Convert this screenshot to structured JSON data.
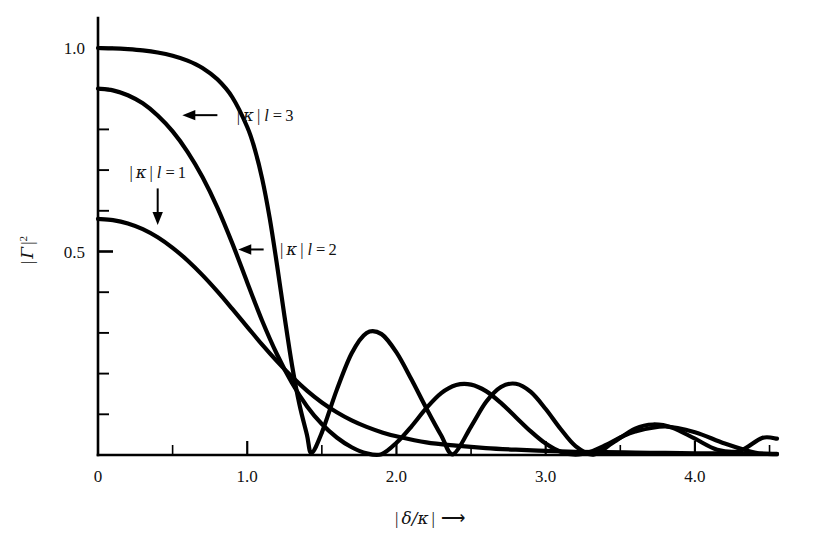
{
  "figure": {
    "kind": "line-plot",
    "background": "#ffffff",
    "ink_color": "#000000"
  },
  "axes": {
    "x": {
      "label": "| δ/κ | ⟶",
      "label_parts": {
        "bar_open": "|",
        "symbol": "δ/κ",
        "bar_close": "|",
        "arrow": "⟶"
      },
      "min": 0,
      "max": 4.55,
      "major_ticks": [
        0,
        1.0,
        2.0,
        3.0,
        4.0
      ],
      "major_tick_labels": [
        "0",
        "1.0",
        "2.0",
        "3.0",
        "4.0"
      ],
      "minor_tick_step": 0.5
    },
    "y": {
      "label": "| Γ |²",
      "label_parts": {
        "bar_open": "|",
        "symbol": "Γ",
        "bar_close": "|",
        "exponent": "2"
      },
      "min": 0,
      "max": 1.12,
      "major_ticks": [
        0.5,
        1.0
      ],
      "major_tick_labels": [
        "0.5",
        "1.0"
      ],
      "minor_tick_step": 0.1
    },
    "frame": {
      "left_spine": true,
      "bottom_spine": true,
      "top_spine": false,
      "right_spine": false
    }
  },
  "annotations": [
    {
      "name": "kappa-l-3",
      "text": "| κ | l = 3",
      "bar_open": "|",
      "symbol": "κ",
      "bar_close": "|",
      "var": "l",
      "eq": "=",
      "value": "3",
      "arrow": "left",
      "text_x": 0.93,
      "text_y": 0.835,
      "arrow_from_x": 0.8,
      "arrow_to_x": 0.565
    },
    {
      "name": "kappa-l-2",
      "text": "| κ | l = 2",
      "bar_open": "|",
      "symbol": "κ",
      "bar_close": "|",
      "var": "l",
      "eq": "=",
      "value": "2",
      "arrow": "left",
      "text_x": 1.22,
      "text_y": 0.505,
      "arrow_from_x": 1.11,
      "arrow_to_x": 0.94
    },
    {
      "name": "kappa-l-1",
      "text": "| κ | l = 1",
      "bar_open": "|",
      "symbol": "κ",
      "bar_close": "|",
      "var": "l",
      "eq": "=",
      "value": "1",
      "arrow": "down",
      "text_x": 0.4,
      "text_y": 0.695,
      "arrow_from_y": 0.655,
      "arrow_to_y": 0.565
    }
  ],
  "chart_data": {
    "type": "line",
    "title": "",
    "xlabel": "| δ/κ |",
    "ylabel": "| Γ |²",
    "xlim": [
      0,
      4.55
    ],
    "ylim": [
      0,
      1.12
    ],
    "grid": false,
    "legend": "inline-annotations",
    "x_major_ticks": [
      0,
      1.0,
      2.0,
      3.0,
      4.0
    ],
    "y_major_ticks": [
      0.5,
      1.0
    ],
    "formula": "|Γ|^2 = sinh^2(s l) / ( cosh^2(s l) - (δ/κ)^2 ), s l = |κ|l*sqrt(1-(δ/κ)^2) inside stopband; sin form outside",
    "series": [
      {
        "name": "|κ|l = 1",
        "kl": 1,
        "peak_value": 0.58,
        "x": [
          0.0,
          0.1,
          0.2,
          0.3,
          0.4,
          0.5,
          0.6,
          0.7,
          0.8,
          0.9,
          1.0,
          1.1,
          1.2,
          1.3,
          1.4,
          1.5,
          1.6,
          1.7,
          1.8,
          1.9,
          2.0,
          2.2,
          2.4,
          2.6,
          2.8,
          3.0,
          3.2,
          3.4,
          3.6,
          3.8,
          4.0,
          4.2,
          4.4,
          4.55
        ],
        "y": [
          0.58,
          0.577,
          0.569,
          0.555,
          0.535,
          0.509,
          0.478,
          0.442,
          0.402,
          0.359,
          0.315,
          0.271,
          0.23,
          0.192,
          0.158,
          0.129,
          0.105,
          0.085,
          0.069,
          0.056,
          0.046,
          0.031,
          0.023,
          0.017,
          0.013,
          0.01,
          0.008,
          0.007,
          0.006,
          0.005,
          0.004,
          0.004,
          0.003,
          0.003
        ]
      },
      {
        "name": "|κ|l = 2",
        "kl": 2,
        "peak_value": 0.9,
        "first_zero": 1.8,
        "second_zero": 2.8,
        "lobe_peaks": [
          {
            "x": 2.3,
            "y": 0.175
          },
          {
            "x": 3.2,
            "y": 0.07
          },
          {
            "x": 4.05,
            "y": 0.04
          }
        ],
        "x": [
          0.0,
          0.1,
          0.2,
          0.3,
          0.4,
          0.5,
          0.6,
          0.7,
          0.8,
          0.9,
          1.0,
          1.1,
          1.2,
          1.3,
          1.4,
          1.5,
          1.6,
          1.7,
          1.8,
          1.9,
          2.0,
          2.1,
          2.2,
          2.3,
          2.4,
          2.5,
          2.6,
          2.7,
          2.8,
          2.9,
          3.0,
          3.1,
          3.2,
          3.3,
          3.4,
          3.5,
          3.6,
          3.8,
          4.0,
          4.2,
          4.4,
          4.55
        ],
        "y": [
          0.9,
          0.896,
          0.884,
          0.864,
          0.834,
          0.795,
          0.745,
          0.683,
          0.608,
          0.52,
          0.424,
          0.33,
          0.247,
          0.177,
          0.12,
          0.076,
          0.043,
          0.019,
          0.004,
          0.002,
          0.03,
          0.07,
          0.115,
          0.152,
          0.172,
          0.173,
          0.157,
          0.128,
          0.093,
          0.058,
          0.028,
          0.008,
          0.001,
          0.008,
          0.024,
          0.043,
          0.058,
          0.07,
          0.056,
          0.028,
          0.006,
          0.002
        ]
      },
      {
        "name": "|κ|l = 3",
        "kl": 3,
        "peak_value": 1.0,
        "first_zero": 1.43,
        "second_zero": 2.38,
        "third_zero": 3.32,
        "lobe_peaks": [
          {
            "x": 1.82,
            "y": 0.3
          },
          {
            "x": 2.62,
            "y": 0.175
          },
          {
            "x": 3.72,
            "y": 0.075
          },
          {
            "x": 4.45,
            "y": 0.045
          }
        ],
        "x": [
          0.0,
          0.1,
          0.2,
          0.3,
          0.4,
          0.5,
          0.6,
          0.7,
          0.8,
          0.9,
          1.0,
          1.05,
          1.1,
          1.15,
          1.2,
          1.25,
          1.3,
          1.35,
          1.4,
          1.43,
          1.5,
          1.6,
          1.7,
          1.8,
          1.9,
          2.0,
          2.1,
          2.2,
          2.3,
          2.38,
          2.5,
          2.6,
          2.7,
          2.8,
          2.9,
          3.0,
          3.1,
          3.2,
          3.32,
          3.45,
          3.6,
          3.72,
          3.85,
          4.0,
          4.15,
          4.3,
          4.45,
          4.55
        ],
        "y": [
          1.0,
          0.999,
          0.997,
          0.994,
          0.989,
          0.981,
          0.969,
          0.951,
          0.923,
          0.879,
          0.806,
          0.752,
          0.679,
          0.583,
          0.466,
          0.34,
          0.221,
          0.124,
          0.05,
          0.005,
          0.055,
          0.16,
          0.25,
          0.3,
          0.297,
          0.252,
          0.186,
          0.115,
          0.048,
          0.002,
          0.07,
          0.13,
          0.167,
          0.175,
          0.155,
          0.113,
          0.064,
          0.022,
          0.001,
          0.03,
          0.065,
          0.075,
          0.067,
          0.04,
          0.013,
          0.01,
          0.042,
          0.04
        ]
      }
    ]
  }
}
